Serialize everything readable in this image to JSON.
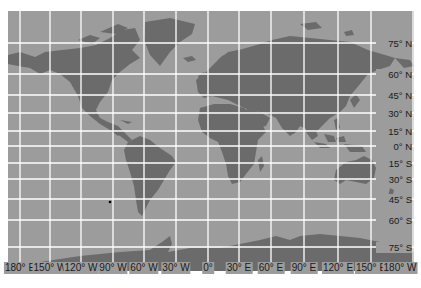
{
  "map": {
    "projection": "Mercator world map",
    "colors": {
      "ocean": "#9c9c9c",
      "land": "#6b6b6b",
      "grid": "#ffffff",
      "label_text": "#1a1a1a"
    },
    "longitude_labels": [
      {
        "text": "180° E",
        "x": 20
      },
      {
        "text": "150° W",
        "x": 50
      },
      {
        "text": "120° W",
        "x": 81
      },
      {
        "text": "90° W",
        "x": 113
      },
      {
        "text": "60° W",
        "x": 144
      },
      {
        "text": "30° W",
        "x": 176
      },
      {
        "text": "0°",
        "x": 208
      },
      {
        "text": "30° E",
        "x": 239
      },
      {
        "text": "60° E",
        "x": 271
      },
      {
        "text": "90° E",
        "x": 304
      },
      {
        "text": "120° E",
        "x": 338
      },
      {
        "text": "150° E",
        "x": 371
      },
      {
        "text": "180° W",
        "x": 400
      }
    ],
    "latitude_labels": [
      {
        "text": "75° N",
        "y": 43
      },
      {
        "text": "60° N",
        "y": 74
      },
      {
        "text": "45° N",
        "y": 95
      },
      {
        "text": "30° N",
        "y": 113
      },
      {
        "text": "15° N",
        "y": 131
      },
      {
        "text": "0° N",
        "y": 146
      },
      {
        "text": "15° S",
        "y": 163
      },
      {
        "text": "30° S",
        "y": 179
      },
      {
        "text": "45° S",
        "y": 199
      },
      {
        "text": "60° S",
        "y": 220
      },
      {
        "text": "75° S",
        "y": 247
      }
    ],
    "marker": {
      "description": "small black dot in South Pacific",
      "x": 110,
      "y": 202
    }
  }
}
